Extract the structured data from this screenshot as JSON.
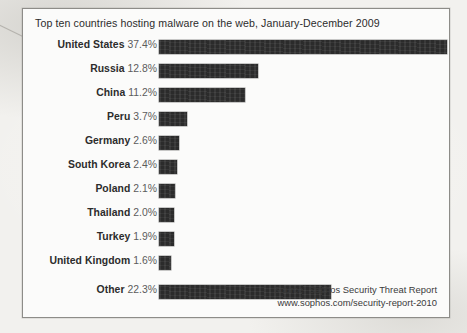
{
  "chart_data": {
    "type": "bar",
    "orientation": "horizontal",
    "title": "Top ten countries hosting malware on the web, January-December 2009",
    "xlabel": "",
    "ylabel": "",
    "xlim": [
      0,
      37.4
    ],
    "grid": false,
    "legend": null,
    "value_suffix": "%",
    "bar_color": "#2b2b2b",
    "categories": [
      "United States",
      "Russia",
      "China",
      "Peru",
      "Germany",
      "South Korea",
      "Poland",
      "Thailand",
      "Turkey",
      "United Kingdom",
      "Other"
    ],
    "values": [
      37.4,
      12.8,
      11.2,
      3.7,
      2.6,
      2.4,
      2.1,
      2.0,
      1.9,
      1.6,
      22.3
    ],
    "value_labels": [
      "37.4%",
      "12.8%",
      "11.2%",
      "3.7%",
      "2.6%",
      "2.4%",
      "2.1%",
      "2.0%",
      "1.9%",
      "1.6%",
      "22.3%"
    ],
    "rows": [
      {
        "country": "United States",
        "pct": "37.4%",
        "value": 37.4,
        "separated": false
      },
      {
        "country": "Russia",
        "pct": "12.8%",
        "value": 12.8,
        "separated": false
      },
      {
        "country": "China",
        "pct": "11.2%",
        "value": 11.2,
        "separated": false
      },
      {
        "country": "Peru",
        "pct": "3.7%",
        "value": 3.7,
        "separated": false
      },
      {
        "country": "Germany",
        "pct": "2.6%",
        "value": 2.6,
        "separated": false
      },
      {
        "country": "South Korea",
        "pct": "2.4%",
        "value": 2.4,
        "separated": false
      },
      {
        "country": "Poland",
        "pct": "2.1%",
        "value": 2.1,
        "separated": false
      },
      {
        "country": "Thailand",
        "pct": "2.0%",
        "value": 2.0,
        "separated": false
      },
      {
        "country": "Turkey",
        "pct": "1.9%",
        "value": 1.9,
        "separated": false
      },
      {
        "country": "United Kingdom",
        "pct": "1.6%",
        "value": 1.6,
        "separated": false
      },
      {
        "country": "Other",
        "pct": "22.3%",
        "value": 22.3,
        "separated": true
      }
    ]
  },
  "source": {
    "line1": "Source: Sophos Security Threat Report",
    "line2": "www.sophos.com/security-report-2010"
  }
}
